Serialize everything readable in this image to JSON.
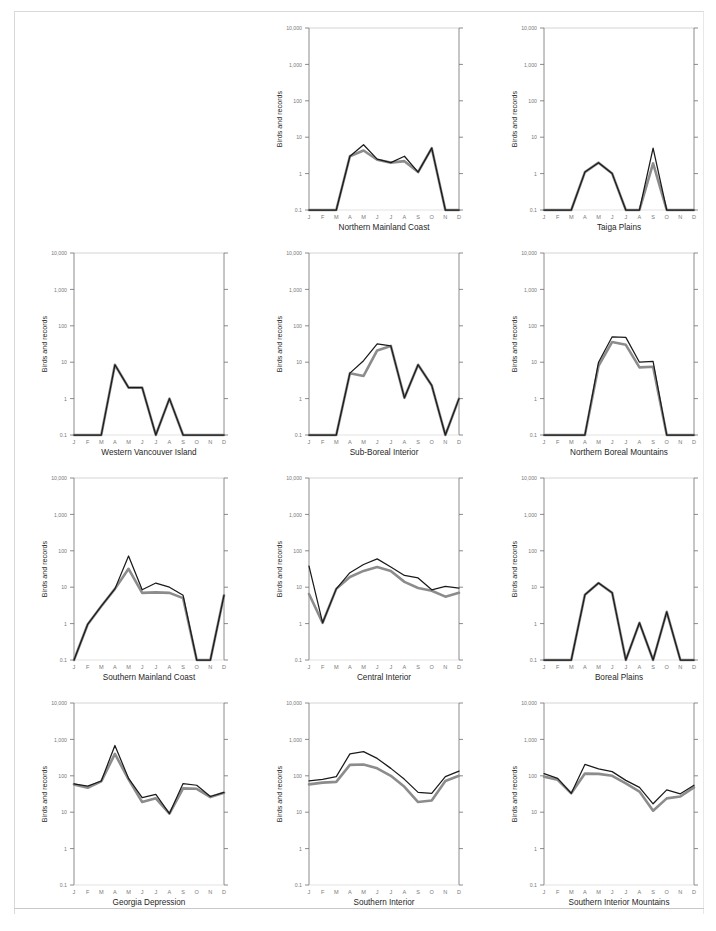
{
  "figure": {
    "y_axis_label": "Birds and records",
    "y_ticks": [
      "10,000",
      "1,000",
      "100",
      "10",
      "1",
      "0.1"
    ],
    "y_tick_values": [
      10000,
      1000,
      100,
      10,
      1,
      0.1
    ],
    "x_tick_labels": [
      "J",
      "F",
      "M",
      "A",
      "M",
      "J",
      "J",
      "A",
      "S",
      "O",
      "N",
      "D"
    ],
    "colors": {
      "line_records": "#1a1a1a",
      "line_birds": "#8c8c8c",
      "axis": "#6e6e6e",
      "gridline": "#c9c9c9",
      "tick_text": "#7a7a7a",
      "title_text": "#1f1f1f",
      "frame": "#d9d9d9"
    },
    "caption": "",
    "grid_layout": {
      "rows": 4,
      "cols": 3,
      "empty_cells": [
        [
          0,
          0
        ]
      ]
    }
  },
  "chart_data": [
    {
      "type": "line",
      "title": "Northern Mainland Coast",
      "xlabel": "",
      "ylabel": "Birds and records",
      "categories": [
        "J",
        "F",
        "M",
        "A",
        "M",
        "J",
        "J",
        "A",
        "S",
        "O",
        "N",
        "D"
      ],
      "ylim": [
        0.1,
        10000
      ],
      "yscale": "log",
      "grid": "top-only",
      "series": [
        {
          "name": "records",
          "color": "#1a1a1a",
          "values": [
            0.1,
            0.1,
            0.1,
            3.0,
            6.2,
            2.5,
            2.0,
            3.0,
            1.1,
            5.0,
            0.1,
            0.1
          ]
        },
        {
          "name": "birds",
          "color": "#8c8c8c",
          "values": [
            0.1,
            0.1,
            0.1,
            3.0,
            4.3,
            2.4,
            2.0,
            2.2,
            1.1,
            5.0,
            0.1,
            0.1
          ]
        }
      ]
    },
    {
      "type": "line",
      "title": "Taiga Plains",
      "xlabel": "",
      "ylabel": "Birds and records",
      "categories": [
        "J",
        "F",
        "M",
        "A",
        "M",
        "J",
        "J",
        "A",
        "S",
        "O",
        "N",
        "D"
      ],
      "ylim": [
        0.1,
        10000
      ],
      "yscale": "log",
      "grid": "top-only",
      "series": [
        {
          "name": "records",
          "color": "#1a1a1a",
          "values": [
            0.1,
            0.1,
            0.1,
            1.1,
            2.0,
            1.0,
            0.1,
            0.1,
            5.0,
            0.1,
            0.1,
            0.1
          ]
        },
        {
          "name": "birds",
          "color": "#8c8c8c",
          "values": [
            0.1,
            0.1,
            0.1,
            1.1,
            2.0,
            1.0,
            0.1,
            0.1,
            1.9,
            0.1,
            0.1,
            0.1
          ]
        }
      ]
    },
    {
      "type": "line",
      "title": "Western Vancouver Island",
      "xlabel": "",
      "ylabel": "Birds and records",
      "categories": [
        "J",
        "F",
        "M",
        "A",
        "M",
        "J",
        "J",
        "A",
        "S",
        "O",
        "N",
        "D"
      ],
      "ylim": [
        0.1,
        10000
      ],
      "yscale": "log",
      "grid": "top-only",
      "series": [
        {
          "name": "records",
          "color": "#1a1a1a",
          "values": [
            0.1,
            0.1,
            0.1,
            8.5,
            2.0,
            2.0,
            0.1,
            1.0,
            0.1,
            0.1,
            0.1,
            0.1
          ]
        },
        {
          "name": "birds",
          "color": "#8c8c8c",
          "values": [
            0.1,
            0.1,
            0.1,
            8.5,
            2.0,
            2.0,
            0.1,
            1.0,
            0.1,
            0.1,
            0.1,
            0.1
          ]
        }
      ]
    },
    {
      "type": "line",
      "title": "Sub-Boreal Interior",
      "xlabel": "",
      "ylabel": "Birds and records",
      "categories": [
        "J",
        "F",
        "M",
        "A",
        "M",
        "J",
        "J",
        "A",
        "S",
        "O",
        "N",
        "D"
      ],
      "ylim": [
        0.1,
        10000
      ],
      "yscale": "log",
      "grid": "top-only",
      "series": [
        {
          "name": "records",
          "color": "#1a1a1a",
          "values": [
            0.1,
            0.1,
            0.1,
            5.0,
            11.0,
            32.0,
            28.0,
            1.05,
            8.5,
            2.3,
            0.1,
            1.0
          ]
        },
        {
          "name": "birds",
          "color": "#8c8c8c",
          "values": [
            0.1,
            0.1,
            0.1,
            5.0,
            4.2,
            21.0,
            28.0,
            1.05,
            8.5,
            2.3,
            0.1,
            1.0
          ]
        }
      ]
    },
    {
      "type": "line",
      "title": "Northern Boreal Mountains",
      "xlabel": "",
      "ylabel": "Birds and records",
      "categories": [
        "J",
        "F",
        "M",
        "A",
        "M",
        "J",
        "J",
        "A",
        "S",
        "O",
        "N",
        "D"
      ],
      "ylim": [
        0.1,
        10000
      ],
      "yscale": "log",
      "grid": "top-only",
      "series": [
        {
          "name": "records",
          "color": "#1a1a1a",
          "values": [
            0.1,
            0.1,
            0.1,
            0.1,
            10.0,
            50.0,
            48.0,
            10.0,
            10.5,
            0.1,
            0.1,
            0.1
          ]
        },
        {
          "name": "birds",
          "color": "#8c8c8c",
          "values": [
            0.1,
            0.1,
            0.1,
            0.1,
            8.0,
            36.0,
            30.0,
            7.2,
            7.5,
            0.1,
            0.1,
            0.1
          ]
        }
      ]
    },
    {
      "type": "line",
      "title": "Southern Mainland Coast",
      "xlabel": "",
      "ylabel": "Birds and records",
      "categories": [
        "J",
        "F",
        "M",
        "A",
        "M",
        "J",
        "J",
        "A",
        "S",
        "O",
        "N",
        "D"
      ],
      "ylim": [
        0.1,
        10000
      ],
      "yscale": "log",
      "grid": "top-only",
      "series": [
        {
          "name": "records",
          "color": "#1a1a1a",
          "values": [
            0.1,
            0.95,
            3.0,
            9.0,
            72.0,
            8.5,
            13.0,
            10.0,
            6.0,
            0.1,
            0.1,
            6.0
          ]
        },
        {
          "name": "birds",
          "color": "#8c8c8c",
          "values": [
            0.1,
            0.95,
            3.0,
            9.0,
            32.0,
            7.0,
            7.2,
            7.0,
            5.0,
            0.1,
            0.1,
            6.0
          ]
        }
      ]
    },
    {
      "type": "line",
      "title": "Central Interior",
      "xlabel": "",
      "ylabel": "Birds and records",
      "categories": [
        "J",
        "F",
        "M",
        "A",
        "M",
        "J",
        "J",
        "A",
        "S",
        "O",
        "N",
        "D"
      ],
      "ylim": [
        0.1,
        10000
      ],
      "yscale": "log",
      "grid": "top-only",
      "series": [
        {
          "name": "records",
          "color": "#1a1a1a",
          "values": [
            38.0,
            1.05,
            9.0,
            25.0,
            42.0,
            60.0,
            36.0,
            21.0,
            18.0,
            8.5,
            10.5,
            9.5
          ]
        },
        {
          "name": "birds",
          "color": "#8c8c8c",
          "values": [
            6.5,
            1.05,
            9.0,
            19.0,
            28.0,
            36.0,
            28.0,
            14.0,
            9.5,
            8.0,
            5.5,
            7.0
          ]
        }
      ]
    },
    {
      "type": "line",
      "title": "Boreal Plains",
      "xlabel": "",
      "ylabel": "Birds and records",
      "categories": [
        "J",
        "F",
        "M",
        "A",
        "M",
        "J",
        "J",
        "A",
        "S",
        "O",
        "N",
        "D"
      ],
      "ylim": [
        0.1,
        10000
      ],
      "yscale": "log",
      "grid": "top-only",
      "series": [
        {
          "name": "records",
          "color": "#1a1a1a",
          "values": [
            0.1,
            0.1,
            0.1,
            6.2,
            13.0,
            7.0,
            0.1,
            1.05,
            0.1,
            2.1,
            0.1,
            0.1
          ]
        },
        {
          "name": "birds",
          "color": "#8c8c8c",
          "values": [
            0.1,
            0.1,
            0.1,
            6.2,
            13.0,
            7.0,
            0.1,
            1.05,
            0.1,
            2.1,
            0.1,
            0.1
          ]
        }
      ]
    },
    {
      "type": "line",
      "title": "Georgia Depression",
      "xlabel": "",
      "ylabel": "Birds and records",
      "categories": [
        "J",
        "F",
        "M",
        "A",
        "M",
        "J",
        "J",
        "A",
        "S",
        "O",
        "N",
        "D"
      ],
      "ylim": [
        0.1,
        10000
      ],
      "yscale": "log",
      "grid": "top-only",
      "series": [
        {
          "name": "records",
          "color": "#1a1a1a",
          "values": [
            60.0,
            52.0,
            72.0,
            680.0,
            85.0,
            25.0,
            31.0,
            9.2,
            61.0,
            55.0,
            27.0,
            35.0
          ]
        },
        {
          "name": "birds",
          "color": "#8c8c8c",
          "values": [
            58.0,
            47.0,
            70.0,
            400.0,
            80.0,
            19.0,
            24.0,
            9.2,
            45.0,
            44.0,
            26.0,
            34.0
          ]
        }
      ]
    },
    {
      "type": "line",
      "title": "Southern Interior",
      "xlabel": "",
      "ylabel": "Birds and records",
      "categories": [
        "J",
        "F",
        "M",
        "A",
        "M",
        "J",
        "J",
        "A",
        "S",
        "O",
        "N",
        "D"
      ],
      "ylim": [
        0.1,
        10000
      ],
      "yscale": "log",
      "grid": "top-only",
      "series": [
        {
          "name": "records",
          "color": "#1a1a1a",
          "values": [
            72.0,
            80.0,
            95.0,
            400.0,
            460.0,
            300.0,
            160.0,
            80.0,
            35.0,
            33.0,
            95.0,
            135.0
          ]
        },
        {
          "name": "birds",
          "color": "#8c8c8c",
          "values": [
            58.0,
            65.0,
            68.0,
            200.0,
            205.0,
            160.0,
            100.0,
            50.0,
            19.0,
            21.0,
            72.0,
            100.0
          ]
        }
      ]
    },
    {
      "type": "line",
      "title": "Southern Interior Mountains",
      "xlabel": "",
      "ylabel": "Birds and records",
      "categories": [
        "J",
        "F",
        "M",
        "A",
        "M",
        "J",
        "J",
        "A",
        "S",
        "O",
        "N",
        "D"
      ],
      "ylim": [
        0.1,
        10000
      ],
      "yscale": "log",
      "grid": "top-only",
      "series": [
        {
          "name": "records",
          "color": "#1a1a1a",
          "values": [
            115.0,
            85.0,
            33.0,
            205.0,
            155.0,
            130.0,
            75.0,
            48.0,
            17.0,
            41.0,
            32.0,
            55.0
          ]
        },
        {
          "name": "birds",
          "color": "#8c8c8c",
          "values": [
            95.0,
            78.0,
            33.0,
            115.0,
            113.0,
            100.0,
            62.0,
            37.0,
            11.0,
            24.0,
            27.0,
            48.0
          ]
        }
      ]
    }
  ]
}
